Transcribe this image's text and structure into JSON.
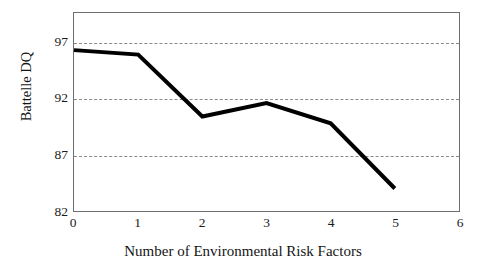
{
  "chart_data": {
    "type": "line",
    "title": "",
    "xlabel": "Number of Environmental Risk Factors",
    "ylabel": "Battelle DQ",
    "x": [
      0,
      1,
      2,
      3,
      4,
      5
    ],
    "values": [
      96.3,
      95.9,
      90.4,
      91.6,
      89.8,
      84.0
    ],
    "series": [
      {
        "name": "Battelle DQ",
        "values": [
          96.3,
          95.9,
          90.4,
          91.6,
          89.8,
          84.0
        ]
      }
    ],
    "xlim": [
      0,
      6
    ],
    "ylim": [
      82,
      99.6
    ],
    "xticks": [
      0,
      1,
      2,
      3,
      4,
      5,
      6
    ],
    "xtick_labels": [
      "0",
      "1",
      "2",
      "3",
      "4",
      "5",
      "6"
    ],
    "yticks": [
      82,
      87,
      92,
      97
    ],
    "ytick_labels": [
      "82",
      "87",
      "92",
      "97"
    ],
    "gridlines": {
      "horizontal_at": [
        87,
        92,
        97
      ],
      "vertical": false,
      "style": "dashed",
      "color": "#8a8a8a"
    },
    "legend": {
      "visible": false,
      "position": "none"
    },
    "line_color": "#000000",
    "line_width_px": 4,
    "frame_color": "#6e6e6e",
    "background_color": "#ffffff",
    "markers": false,
    "annotations": []
  }
}
